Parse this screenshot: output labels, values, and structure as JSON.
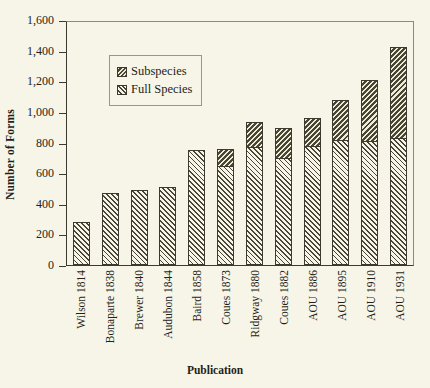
{
  "chart_data": {
    "type": "bar",
    "subtype": "stacked-vertical",
    "title": "",
    "xlabel": "Publication",
    "ylabel": "Number of Forms",
    "ylim": [
      0,
      1600
    ],
    "ytick_step": 200,
    "ytick_labels": [
      "1,600",
      "1,400",
      "1,200",
      "1,000",
      "800",
      "600",
      "400",
      "200",
      "0"
    ],
    "ytick_values": [
      1600,
      1400,
      1200,
      1000,
      800,
      600,
      400,
      200,
      0
    ],
    "grid": false,
    "legend_position": "upper-left-inside",
    "categories": [
      "Wilson 1814",
      "Bonaparte 1838",
      "Brewer 1840",
      "Audubon 1844",
      "Baird 1858",
      "Coues 1873",
      "Ridgway 1880",
      "Coues 1882",
      "AOU 1886",
      "AOU 1895",
      "AOU 1910",
      "AOU 1931"
    ],
    "series": [
      {
        "name": "Full Species",
        "pattern": "forward-hatch-light",
        "values": [
          280,
          470,
          490,
          510,
          750,
          640,
          765,
          690,
          770,
          810,
          805,
          820
        ]
      },
      {
        "name": "Subspecies",
        "pattern": "back-hatch-dark",
        "values": [
          0,
          0,
          0,
          0,
          0,
          115,
          170,
          205,
          190,
          265,
          400,
          605
        ]
      }
    ],
    "totals": [
      280,
      470,
      490,
      510,
      750,
      755,
      935,
      895,
      960,
      1075,
      1205,
      1425
    ]
  },
  "legend": {
    "items": [
      {
        "label": "Subspecies"
      },
      {
        "label": "Full Species"
      }
    ]
  },
  "colors": {
    "background": "#f7f5e8",
    "ink": "#231f18",
    "axis": "#3c3a30",
    "frame_light": "#8d8a77",
    "hatch": "#4a4636"
  }
}
